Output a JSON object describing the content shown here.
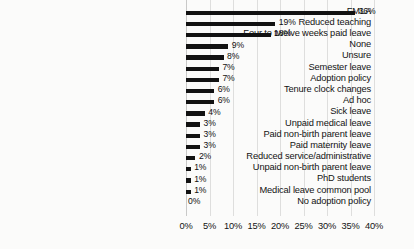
{
  "chart_data": {
    "type": "bar",
    "orientation": "horizontal",
    "title": "",
    "subtitle": "",
    "xlabel": "",
    "ylabel": "",
    "xlim": [
      0,
      40
    ],
    "xtick_step": 5,
    "xticks": [
      "0%",
      "5%",
      "10%",
      "15%",
      "20%",
      "25%",
      "30%",
      "35%",
      "40%"
    ],
    "xtick_values": [
      0,
      5,
      10,
      15,
      20,
      25,
      30,
      35,
      40
    ],
    "grid": "vertical",
    "legend": "none",
    "bar_color": "#121212",
    "background_color": "#fbfbfa",
    "gridline_color": "#dededd",
    "categories": [
      "FMLA",
      "Reduced teaching",
      "Four to twelve weeks paid leave",
      "None",
      "Unsure",
      "Semester leave",
      "Adoption policy",
      "Tenure clock changes",
      "Ad hoc",
      "Sick leave",
      "Unpaid medical leave",
      "Paid non-birth parent leave",
      "Paid maternity leave",
      "Reduced service/administrative",
      "Unpaid non-birth parent leave",
      "PhD students",
      "Medical leave common pool",
      "No adoption policy"
    ],
    "values": [
      36,
      19,
      18,
      9,
      8,
      7,
      7,
      6,
      6,
      4,
      3,
      3,
      3,
      2,
      1,
      1,
      1,
      0
    ],
    "value_labels": [
      "36%",
      "19%",
      "18%",
      "9%",
      "8%",
      "7%",
      "7%",
      "6%",
      "6%",
      "4%",
      "3%",
      "3%",
      "3%",
      "2%",
      "1%",
      "1%",
      "1%",
      "0%"
    ]
  }
}
